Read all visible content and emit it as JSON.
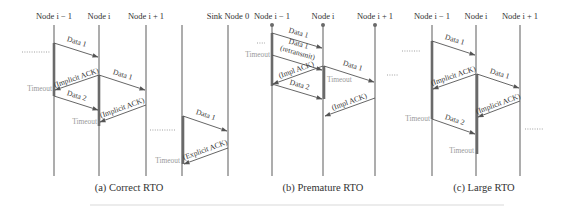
{
  "panels": [
    {
      "id": "a",
      "caption": "(a) Correct RTO",
      "nodes": [
        "Node i − 1",
        "Node i",
        "Node i + 1",
        "",
        "Sink Node 0"
      ],
      "messages": [
        {
          "label": "Data 1",
          "from": 0,
          "to": 1,
          "t0": 0.0,
          "t1": 0.25
        },
        {
          "label": "(Implicit ACK)",
          "from": 1,
          "to": 0,
          "t0": 0.45,
          "t1": 0.7
        },
        {
          "label": "Data 1",
          "from": 1,
          "to": 2,
          "t0": 0.45,
          "t1": 0.7
        },
        {
          "label": "Data 2",
          "from": 0,
          "to": 1,
          "t0": 0.75,
          "t1": 0.97
        },
        {
          "label": "(Implicit ACK)",
          "from": 2,
          "to": 1,
          "t0": 0.92,
          "t1": 1.15
        },
        {
          "label": "Data 1",
          "from": 3,
          "to": 4,
          "t0": 1.2,
          "t1": 1.45
        },
        {
          "label": "(Explicit ACK)",
          "from": 4,
          "to": 3,
          "t0": 1.55,
          "t1": 1.8
        }
      ],
      "timeouts": [
        "Timeout",
        "Timeout",
        "Timeout"
      ]
    },
    {
      "id": "b",
      "caption": "(b) Premature RTO",
      "nodes": [
        "Node i − 1",
        "Node i",
        "Node i + 1"
      ],
      "messages": [
        {
          "label": "Data 1"
        },
        {
          "label": "Data 1",
          "sublabel": "(retransmit)"
        },
        {
          "label": "(Impl ACK)"
        },
        {
          "label": "Data 1"
        },
        {
          "label": "Data 2"
        },
        {
          "label": "(Impl ACK)"
        }
      ],
      "timeouts": [
        "Timeout",
        "Timeout"
      ]
    },
    {
      "id": "c",
      "caption": "(c) Large RTO",
      "nodes": [
        "Node i − 1",
        "Node i",
        "Node i + 1"
      ],
      "messages": [
        {
          "label": "Data 1"
        },
        {
          "label": "(Implicit ACK)"
        },
        {
          "label": "Data 1"
        },
        {
          "label": "(Implicit ACK)"
        },
        {
          "label": "Data 2"
        }
      ],
      "timeouts": [
        "Timeout",
        "Timeout"
      ]
    }
  ]
}
